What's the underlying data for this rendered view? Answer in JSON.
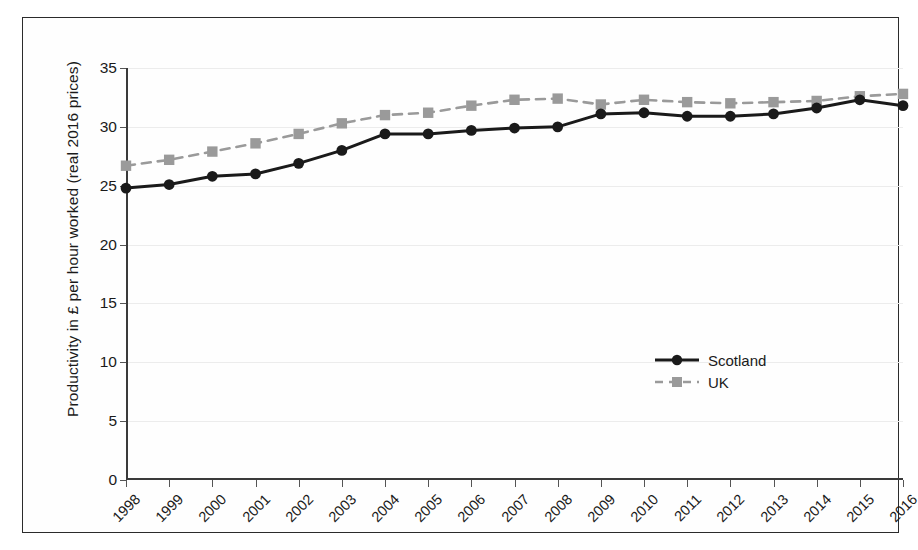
{
  "chart_data": {
    "type": "line",
    "title": "",
    "subtitle": "",
    "xlabel": "",
    "ylabel": "Productivity in £ per hour worked (real 2016 prices)",
    "categories": [
      "1998",
      "1999",
      "2000",
      "2001",
      "2002",
      "2003",
      "2004",
      "2005",
      "2006",
      "2007",
      "2008",
      "2009",
      "2010",
      "2011",
      "2012",
      "2013",
      "2014",
      "2015",
      "2016"
    ],
    "ylim": [
      0,
      35
    ],
    "yticks": [
      0,
      5,
      10,
      15,
      20,
      25,
      30,
      35
    ],
    "ytick_labels": [
      "0",
      "5",
      "10",
      "15",
      "20",
      "25",
      "30",
      "35"
    ],
    "grid": true,
    "grid_axis": "y",
    "legend_position": "inside-right-middle",
    "series": [
      {
        "name": "Scotland",
        "color": "#1a1a1a",
        "line_style": "solid",
        "marker": "circle",
        "values": [
          24.8,
          25.1,
          25.8,
          26.0,
          26.9,
          28.0,
          29.4,
          29.4,
          29.7,
          29.9,
          30.0,
          31.1,
          31.2,
          30.9,
          30.9,
          31.1,
          31.6,
          32.3,
          31.8
        ]
      },
      {
        "name": "UK",
        "color": "#9a9a9a",
        "line_style": "dashed",
        "marker": "square",
        "values": [
          26.7,
          27.2,
          27.9,
          28.6,
          29.4,
          30.3,
          31.0,
          31.2,
          31.8,
          32.3,
          32.4,
          31.9,
          32.3,
          32.1,
          32.0,
          32.1,
          32.2,
          32.6,
          32.8
        ]
      }
    ]
  },
  "legend": {
    "items": [
      {
        "label": "Scotland"
      },
      {
        "label": "UK"
      }
    ]
  },
  "colors": {
    "scotland": "#1a1a1a",
    "uk": "#9a9a9a",
    "grid": "#ececec",
    "axis": "#3a3a3a",
    "frame": "#2b2b2b",
    "background": "#ffffff"
  }
}
